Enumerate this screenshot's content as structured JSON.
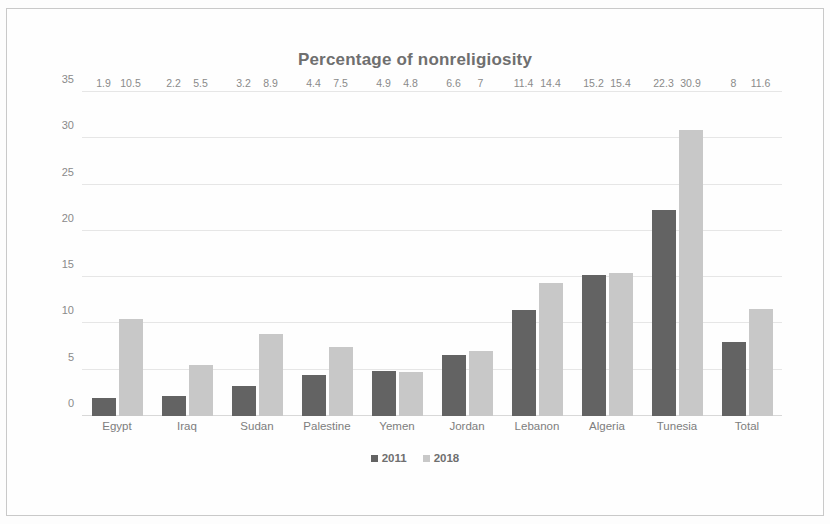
{
  "chart_data": {
    "type": "bar",
    "title": "Percentage of nonreligiosity",
    "xlabel": "",
    "ylabel": "",
    "ylim": [
      0,
      35
    ],
    "yticks": [
      0,
      5,
      10,
      15,
      20,
      25,
      30,
      35
    ],
    "grid": true,
    "legend_position": "bottom",
    "categories": [
      "Egypt",
      "Iraq",
      "Sudan",
      "Palestine",
      "Yemen",
      "Jordan",
      "Lebanon",
      "Algeria",
      "Tunesia",
      "Total"
    ],
    "series": [
      {
        "name": "2011",
        "color": "#636363",
        "values": [
          1.9,
          2.2,
          3.2,
          4.4,
          4.9,
          6.6,
          11.4,
          15.2,
          22.3,
          8
        ],
        "labels": [
          "1.9",
          "2.2",
          "3.2",
          "4.4",
          "4.9",
          "6.6",
          "11.4",
          "15.2",
          "22.3",
          "8"
        ]
      },
      {
        "name": "2018",
        "color": "#c8c8c8",
        "values": [
          10.5,
          5.5,
          8.9,
          7.5,
          4.8,
          7,
          14.4,
          15.4,
          30.9,
          11.6
        ],
        "labels": [
          "10.5",
          "5.5",
          "8.9",
          "7.5",
          "4.8",
          "7",
          "14.4",
          "15.4",
          "30.9",
          "11.6"
        ]
      }
    ]
  }
}
